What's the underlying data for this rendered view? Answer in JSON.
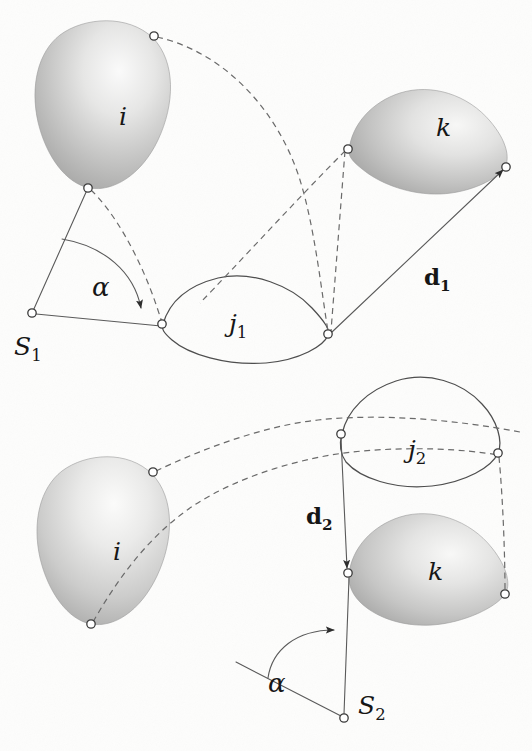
{
  "figure": {
    "background_color": "#fdfdfc",
    "ink_color": "#4e4e4e",
    "dash_color": "#6a6a6a",
    "node_fill": "#ffffff",
    "blob_light": "#f4f4f3",
    "blob_mid": "#c9c9c8",
    "blob_dark": "#a2a2a1"
  },
  "panels": [
    {
      "id": "panel-top",
      "name": "configuration-1",
      "labels": {
        "region_i": "i",
        "region_j": "j",
        "region_j_sub": "1",
        "region_k": "k",
        "sensor": "S",
        "sensor_sub": "1",
        "angle": "α",
        "distance": "d",
        "distance_sub": "1"
      },
      "nodes": [
        {
          "name": "node-i-top",
          "x": 154,
          "y": 36
        },
        {
          "name": "node-i-bottom",
          "x": 88,
          "y": 188
        },
        {
          "name": "node-k-left",
          "x": 348,
          "y": 149
        },
        {
          "name": "node-k-right",
          "x": 506,
          "y": 167
        },
        {
          "name": "node-j1-left",
          "x": 162,
          "y": 324
        },
        {
          "name": "node-j1-right",
          "x": 328,
          "y": 334
        },
        {
          "name": "node-s1",
          "x": 32,
          "y": 313
        }
      ]
    },
    {
      "id": "panel-bottom",
      "name": "configuration-2",
      "labels": {
        "region_i": "i",
        "region_j": "j",
        "region_j_sub": "2",
        "region_k": "k",
        "sensor": "S",
        "sensor_sub": "2",
        "angle": "α",
        "distance": "d",
        "distance_sub": "2"
      },
      "nodes": [
        {
          "name": "node-i2-top",
          "x": 153,
          "y": 472
        },
        {
          "name": "node-i2-bottom",
          "x": 91,
          "y": 624
        },
        {
          "name": "node-j2-left",
          "x": 341,
          "y": 434
        },
        {
          "name": "node-j2-right",
          "x": 498,
          "y": 453
        },
        {
          "name": "node-k2-left",
          "x": 348,
          "y": 573
        },
        {
          "name": "node-k2-right",
          "x": 505,
          "y": 594
        },
        {
          "name": "node-s2",
          "x": 344,
          "y": 718
        }
      ]
    }
  ],
  "label_positions": {
    "i_top": {
      "x": 119,
      "y": 125,
      "size": 25
    },
    "k_top": {
      "x": 436,
      "y": 136,
      "size": 25
    },
    "j1": {
      "x": 229,
      "y": 323,
      "size": 25
    },
    "s1": {
      "x": 16,
      "y": 352,
      "size": 25
    },
    "alpha1": {
      "x": 92,
      "y": 292,
      "size": 25
    },
    "d1": {
      "x": 424,
      "y": 276,
      "size": 23
    },
    "i_bottom": {
      "x": 113,
      "y": 560,
      "size": 25
    },
    "k_bottom": {
      "x": 428,
      "y": 575,
      "size": 25
    },
    "j2": {
      "x": 410,
      "y": 452,
      "size": 25
    },
    "s2": {
      "x": 358,
      "y": 709,
      "size": 25
    },
    "alpha2": {
      "x": 270,
      "y": 687,
      "size": 25
    },
    "d2": {
      "x": 309,
      "y": 519,
      "size": 23
    }
  }
}
